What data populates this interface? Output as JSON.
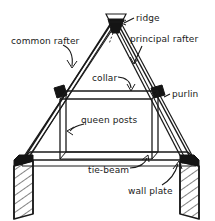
{
  "diagram": {
    "background_color": "#ffffff",
    "line_color": "#1a1a1a",
    "joint_fill_color": "#141414",
    "text_color": "#1a1a1a",
    "labels": [
      {
        "id": "ridge",
        "text": "ridge"
      },
      {
        "id": "common_rafter",
        "text": "common rafter"
      },
      {
        "id": "principal_rafter",
        "text": "principal rafter"
      },
      {
        "id": "collar",
        "text": "collar"
      },
      {
        "id": "purlin",
        "text": "purlin"
      },
      {
        "id": "queen_posts",
        "text": "queen posts"
      },
      {
        "id": "tie_beam",
        "text": "tie-beam"
      },
      {
        "id": "wall_plate",
        "text": "wall plate"
      }
    ],
    "parts": {
      "ridge": "ridge",
      "common_rafter": "common rafter",
      "principal_rafter": "principal rafter",
      "collar": "collar",
      "purlin": "purlin",
      "queen_posts": "queen posts",
      "tie_beam": "tie-beam",
      "wall_plate": "wall plate"
    }
  }
}
